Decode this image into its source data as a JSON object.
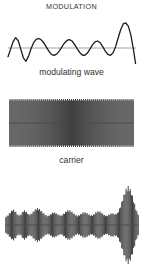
{
  "figure": {
    "title": "MODULATION",
    "background_color": "#ffffff",
    "stroke_color": "#1c1c1c",
    "baseline_color": "#7a7a7a"
  },
  "captions": {
    "modulating": "modulating wave",
    "carrier": "carrier"
  },
  "chart_data": {
    "type": "line",
    "title": "MODULATION",
    "xlabel": "",
    "ylabel": "",
    "grid": false,
    "legend_position": "none",
    "panels": [
      {
        "name": "modulating-wave",
        "label": "modulating wave",
        "type": "line",
        "description": "Smooth low-frequency irregular signal with a horizontal zero baseline; small bumps at left and a tall narrow peak near the right end.",
        "x": [
          0,
          2,
          4,
          6,
          8,
          10,
          12,
          14,
          16,
          18,
          20,
          22,
          24,
          26,
          28,
          30,
          32,
          34,
          36,
          38,
          40,
          42,
          44,
          46,
          48,
          50,
          52,
          54,
          56,
          58,
          60,
          62,
          64,
          66,
          68,
          70,
          72,
          74,
          76,
          78,
          80,
          82,
          84,
          86,
          88,
          90,
          92,
          94,
          96,
          98,
          100
        ],
        "y": [
          -0.62,
          -0.1,
          0.46,
          0.74,
          0.52,
          -0.1,
          -0.7,
          -0.95,
          -0.6,
          -0.05,
          0.38,
          0.62,
          0.68,
          0.58,
          0.36,
          0.06,
          -0.24,
          -0.46,
          -0.52,
          -0.44,
          -0.22,
          0.06,
          0.34,
          0.54,
          0.6,
          0.5,
          0.26,
          -0.04,
          -0.32,
          -0.5,
          -0.52,
          -0.36,
          -0.08,
          0.22,
          0.44,
          0.5,
          0.38,
          0.1,
          -0.22,
          -0.46,
          -0.52,
          -0.36,
          0.08,
          0.7,
          1.3,
          1.72,
          1.8,
          1.56,
          0.92,
          -0.1,
          -1.35
        ],
        "ylim": [
          -2.0,
          2.0
        ],
        "baseline": 0
      },
      {
        "name": "carrier",
        "label": "carrier",
        "type": "line",
        "description": "Uniform high-frequency sinusoid of constant amplitude filling a rectangular band, drawn densely so individual cycles read as vertical strokes.",
        "cycles": 62,
        "amplitude": 1.0,
        "ylim": [
          -1.0,
          1.0
        ],
        "baseline": 0
      },
      {
        "name": "modulated-wave",
        "label": "",
        "type": "line",
        "description": "Amplitude-modulated carrier: high-frequency oscillation whose envelope traces the modulating wave, with the largest excursion near the right side.",
        "cycles": 62,
        "envelope_x": [
          0,
          2,
          4,
          6,
          8,
          10,
          12,
          14,
          16,
          18,
          20,
          22,
          24,
          26,
          28,
          30,
          32,
          34,
          36,
          38,
          40,
          42,
          44,
          46,
          48,
          50,
          52,
          54,
          56,
          58,
          60,
          62,
          64,
          66,
          68,
          70,
          72,
          74,
          76,
          78,
          80,
          82,
          84,
          86,
          88,
          90,
          92,
          94,
          96,
          98,
          100
        ],
        "envelope_y": [
          0.38,
          0.46,
          0.62,
          0.76,
          0.64,
          0.46,
          0.52,
          0.72,
          0.64,
          0.5,
          0.56,
          0.72,
          0.82,
          0.76,
          0.62,
          0.5,
          0.44,
          0.52,
          0.62,
          0.58,
          0.5,
          0.46,
          0.56,
          0.68,
          0.72,
          0.64,
          0.52,
          0.44,
          0.5,
          0.6,
          0.62,
          0.54,
          0.46,
          0.5,
          0.62,
          0.68,
          0.6,
          0.48,
          0.44,
          0.52,
          0.58,
          0.52,
          0.58,
          0.86,
          1.3,
          1.7,
          1.86,
          1.66,
          1.2,
          0.7,
          0.46
        ],
        "ylim": [
          -2.0,
          2.0
        ],
        "baseline": 0
      }
    ]
  }
}
